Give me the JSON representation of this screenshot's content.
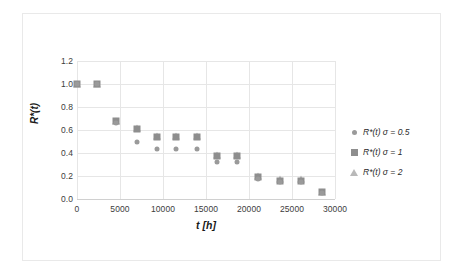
{
  "chart_data": {
    "type": "scatter",
    "title": "",
    "xlabel": "t [h]",
    "ylabel": "R*(t)",
    "xlim": [
      0,
      30000
    ],
    "ylim": [
      0.0,
      1.2
    ],
    "grid": true,
    "legend_position": "right",
    "xticks": [
      "0",
      "5000",
      "10000",
      "15000",
      "20000",
      "25000",
      "30000"
    ],
    "xtick_values": [
      0,
      5000,
      10000,
      15000,
      20000,
      25000,
      30000
    ],
    "yticks": [
      "0.0",
      "0.2",
      "0.4",
      "0.6",
      "0.8",
      "1.0",
      "1.2"
    ],
    "ytick_values": [
      0.0,
      0.2,
      0.4,
      0.6,
      0.8,
      1.0,
      1.2
    ],
    "x": [
      0,
      2300,
      4500,
      7000,
      9300,
      11500,
      13900,
      16300,
      18600,
      21000,
      23600,
      26000,
      28500
    ],
    "series": [
      {
        "name": "R*(t) σ = 0.5",
        "marker": "circle",
        "color": "#9a9a9a",
        "values": [
          1.0,
          1.0,
          0.66,
          0.5,
          0.435,
          0.435,
          0.435,
          0.32,
          0.32,
          0.17,
          0.145,
          0.145,
          0.05
        ]
      },
      {
        "name": "R*(t) σ = 1",
        "marker": "square",
        "color": "#8e8e8e",
        "values": [
          1.0,
          1.0,
          0.675,
          0.61,
          0.535,
          0.535,
          0.535,
          0.375,
          0.375,
          0.19,
          0.16,
          0.16,
          0.06
        ]
      },
      {
        "name": "R*(t) σ = 2",
        "marker": "triangle",
        "color": "#b9b9b9",
        "values": [
          1.0,
          1.0,
          0.68,
          0.615,
          0.545,
          0.545,
          0.545,
          0.385,
          0.385,
          0.2,
          0.17,
          0.17,
          0.065
        ]
      }
    ]
  },
  "legend": {
    "items": [
      {
        "label": "R*(t) σ = 0.5",
        "marker": "circle-marker-icon"
      },
      {
        "label": "R*(t) σ = 1",
        "marker": "square-marker-icon"
      },
      {
        "label": "R*(t) σ = 2",
        "marker": "triangle-marker-icon"
      }
    ]
  },
  "colors": {
    "circle": "#9a9a9a",
    "square": "#8e8e8e",
    "triangle": "#b9b9b9",
    "grid": "#e6e6e6",
    "text": "#3c3c3c",
    "frame": "#e9e9e9"
  }
}
